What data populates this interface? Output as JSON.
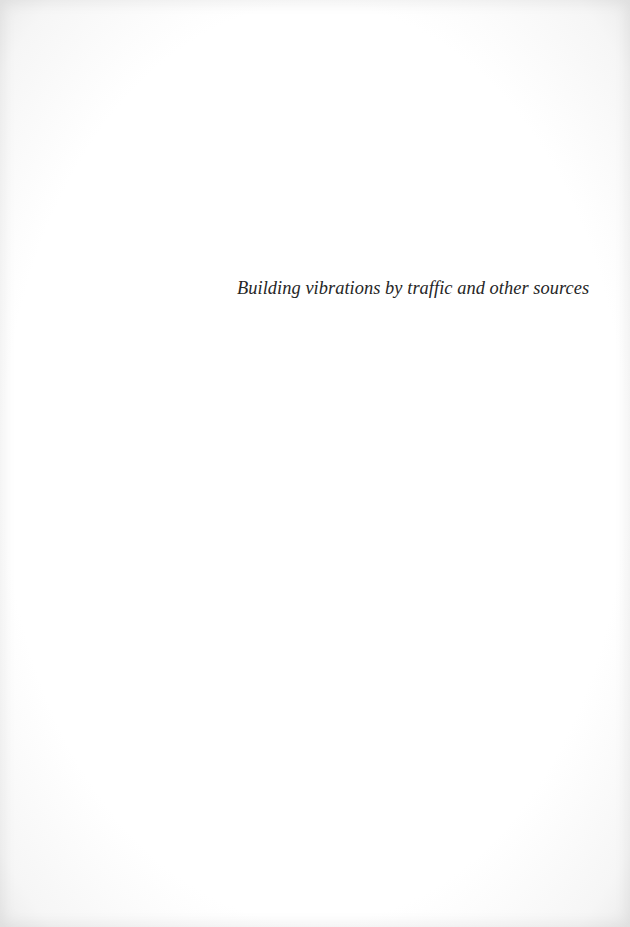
{
  "page": {
    "type": "half-title",
    "title": "Building vibrations by traffic and other sources"
  },
  "colors": {
    "background": "#ffffff",
    "text": "#262626"
  }
}
